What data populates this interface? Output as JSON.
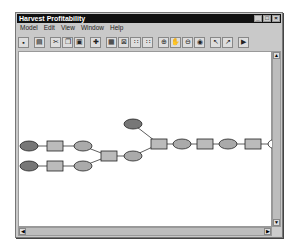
{
  "window": {
    "title": "Harvest Profitability",
    "controls": {
      "minimize": "_",
      "maximize": "□",
      "close": "×"
    }
  },
  "menu": [
    "Model",
    "Edit",
    "View",
    "Window",
    "Help"
  ],
  "toolbar": [
    {
      "name": "save-icon",
      "glyph": "▪"
    },
    {
      "sep": true
    },
    {
      "name": "print-icon",
      "glyph": "▤"
    },
    {
      "sep": true
    },
    {
      "name": "cut-icon",
      "glyph": "✂"
    },
    {
      "name": "copy-icon",
      "glyph": "❐"
    },
    {
      "name": "paste-icon",
      "glyph": "▣"
    },
    {
      "sep": true
    },
    {
      "name": "add-icon",
      "glyph": "✚"
    },
    {
      "sep": true
    },
    {
      "name": "grid-icon",
      "glyph": "▦"
    },
    {
      "name": "select-all-icon",
      "glyph": "⊠"
    },
    {
      "name": "align-icon",
      "glyph": "∷"
    },
    {
      "name": "distribute-icon",
      "glyph": "∷"
    },
    {
      "sep": true
    },
    {
      "name": "zoom-in-icon",
      "glyph": "⊕"
    },
    {
      "name": "pan-icon",
      "glyph": "✋"
    },
    {
      "name": "zoom-out-icon",
      "glyph": "⊖"
    },
    {
      "name": "overview-icon",
      "glyph": "◉"
    },
    {
      "sep": true
    },
    {
      "name": "pointer-icon",
      "glyph": "↖"
    },
    {
      "name": "connect-icon",
      "glyph": "↗"
    },
    {
      "sep": true
    },
    {
      "name": "run-icon",
      "glyph": "▶"
    }
  ],
  "diagram": {
    "colors": {
      "input_oval": "#777777",
      "process_box": "#bbbbbb",
      "output_oval": "#aaaaaa",
      "final_oval": "#ffffff",
      "edge": "#333333"
    },
    "nodes": [
      {
        "id": "n1",
        "type": "input",
        "x": 28,
        "y": 84
      },
      {
        "id": "n2",
        "type": "process",
        "x": 54,
        "y": 84
      },
      {
        "id": "n3",
        "type": "output",
        "x": 82,
        "y": 84
      },
      {
        "id": "n4",
        "type": "input",
        "x": 28,
        "y": 104
      },
      {
        "id": "n5",
        "type": "process",
        "x": 54,
        "y": 104
      },
      {
        "id": "n6",
        "type": "output",
        "x": 82,
        "y": 104
      },
      {
        "id": "n7",
        "type": "process",
        "x": 108,
        "y": 94
      },
      {
        "id": "n8",
        "type": "input",
        "x": 132,
        "y": 62
      },
      {
        "id": "n9",
        "type": "output",
        "x": 132,
        "y": 94
      },
      {
        "id": "n10",
        "type": "process",
        "x": 158,
        "y": 82
      },
      {
        "id": "n11",
        "type": "output",
        "x": 181,
        "y": 82
      },
      {
        "id": "n12",
        "type": "process",
        "x": 204,
        "y": 82
      },
      {
        "id": "n13",
        "type": "output",
        "x": 227,
        "y": 82
      },
      {
        "id": "n14",
        "type": "process",
        "x": 252,
        "y": 82
      },
      {
        "id": "n15",
        "type": "final",
        "x": 276,
        "y": 82
      }
    ],
    "edges": [
      [
        "n1",
        "n2"
      ],
      [
        "n2",
        "n3"
      ],
      [
        "n4",
        "n5"
      ],
      [
        "n5",
        "n6"
      ],
      [
        "n3",
        "n7"
      ],
      [
        "n6",
        "n7"
      ],
      [
        "n7",
        "n9"
      ],
      [
        "n9",
        "n10"
      ],
      [
        "n8",
        "n10"
      ],
      [
        "n10",
        "n11"
      ],
      [
        "n11",
        "n12"
      ],
      [
        "n12",
        "n13"
      ],
      [
        "n13",
        "n14"
      ],
      [
        "n14",
        "n15"
      ]
    ]
  },
  "scrollbars": {
    "up": "▲",
    "down": "▼",
    "left": "◀",
    "right": "▶"
  }
}
